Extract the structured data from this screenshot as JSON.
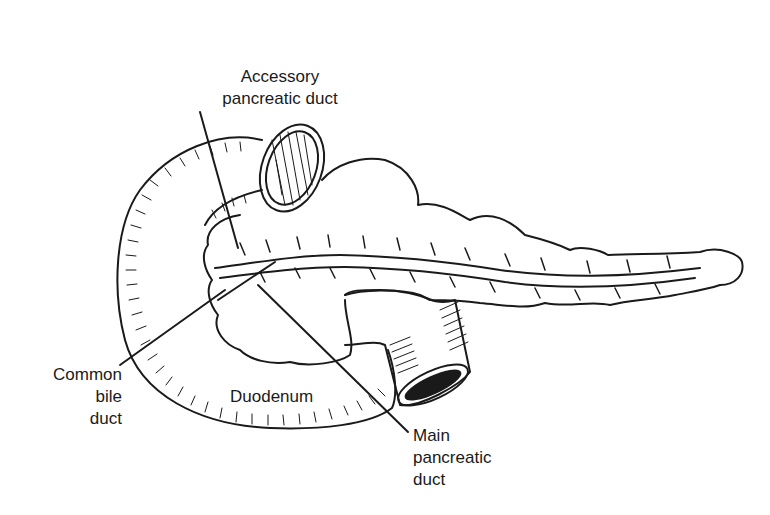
{
  "figure": {
    "line_color": "#1a1a1a",
    "background": "#ffffff"
  },
  "labels": {
    "accessory_duct": {
      "line1": "Accessory",
      "line2": "pancreatic duct"
    },
    "common_bile_duct": {
      "line1": "Common",
      "line2": "bile",
      "line3": "duct"
    },
    "duodenum": {
      "line1": "Duodenum"
    },
    "main_duct": {
      "line1": "Main",
      "line2": "pancreatic",
      "line3": "duct"
    }
  }
}
